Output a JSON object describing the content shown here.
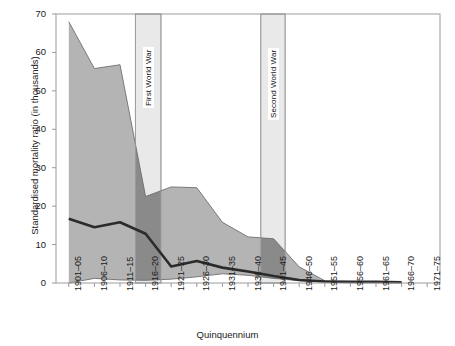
{
  "chart_data": {
    "type": "area",
    "title": "",
    "xlabel": "Quinquennium",
    "ylabel": "Standardised mortality ratio (in thousands)",
    "categories": [
      "1901–05",
      "1906–10",
      "1911–15",
      "1916–20",
      "1921–25",
      "1926–30",
      "1931–35",
      "1936–40",
      "1941–45",
      "1946–50",
      "1951–55",
      "1956–60",
      "1961–65",
      "1966–70",
      "1971–75"
    ],
    "ylim": [
      0,
      70
    ],
    "yticks": [
      0,
      10,
      20,
      30,
      40,
      50,
      60,
      70
    ],
    "grid": false,
    "legend": "none",
    "series": [
      {
        "name": "Upper bound",
        "values": [
          68.0,
          55.8,
          56.8,
          22.5,
          25.0,
          24.8,
          15.8,
          12.0,
          11.5,
          4.2,
          0.6,
          0.4,
          0.3,
          0.2,
          null
        ]
      },
      {
        "name": "Median",
        "values": [
          16.7,
          14.5,
          15.8,
          12.8,
          4.3,
          5.7,
          4.0,
          3.0,
          1.8,
          0.8,
          0.4,
          0.3,
          0.3,
          0.2,
          null
        ]
      },
      {
        "name": "Lower bound",
        "values": [
          0.0,
          1.2,
          0.8,
          0.7,
          1.0,
          1.6,
          2.4,
          2.0,
          1.2,
          0.6,
          0.3,
          0.2,
          0.2,
          0.1,
          null
        ]
      }
    ],
    "annotations": [
      {
        "label": "First World War",
        "start": "1914",
        "end": "1918",
        "x_start_category_index": 2.6,
        "x_end_category_index": 3.6
      },
      {
        "label": "Second World War",
        "start": "1939",
        "end": "1945",
        "x_start_category_index": 7.5,
        "x_end_category_index": 8.45
      }
    ],
    "colors": {
      "band_fill": "#b4b4b4",
      "band_edge": "#6f6f6f",
      "median_line": "#2b2b2b",
      "war_band": "#e9e9e9",
      "war_band_edge": "#9a9a9a",
      "war_band_overlap": "#8a8a8a",
      "axis": "#9b9b9b",
      "text": "#1a1a1a"
    }
  },
  "axes": {
    "y_tick_labels": [
      "70",
      "60",
      "50",
      "40",
      "30",
      "20",
      "10",
      "0"
    ],
    "x_tick_labels": [
      "1901–05",
      "1906–10",
      "1911–15",
      "1916–20",
      "1921–25",
      "1926–30",
      "1931–35",
      "1936–40",
      "1941–45",
      "1946–50",
      "1951–55",
      "1956–60",
      "1961–65",
      "1966–70",
      "1971–75"
    ],
    "x_title": "Quinquennium",
    "y_title": "Standardised mortality ratio (in thousands)"
  },
  "annotations": {
    "ww1": "First World War",
    "ww2": "Second World War"
  }
}
